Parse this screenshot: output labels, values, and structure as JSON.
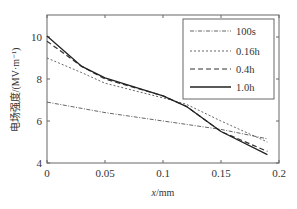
{
  "chart_data": {
    "type": "line",
    "title": "",
    "xlabel": "x/mm",
    "ylabel": "电场强度/(MV·m⁻¹)",
    "xlim": [
      0,
      0.2
    ],
    "ylim": [
      4,
      11
    ],
    "xticks": [
      0,
      0.05,
      0.1,
      0.15,
      0.2
    ],
    "xtick_labels": [
      "0",
      "0.05",
      "0.1",
      "0.15",
      "0.2"
    ],
    "yticks": [
      4,
      6,
      8,
      10
    ],
    "ytick_labels": [
      "4",
      "6",
      "8",
      "10"
    ],
    "grid": false,
    "legend_position": "upper right",
    "series": [
      {
        "name": "100s",
        "style": "dash-dot",
        "color": "#555555",
        "x": [
          0,
          0.05,
          0.1,
          0.15,
          0.19
        ],
        "y": [
          6.9,
          6.4,
          6.0,
          5.6,
          5.15
        ]
      },
      {
        "name": "0.16h",
        "style": "dotted",
        "color": "#555555",
        "x": [
          0,
          0.03,
          0.05,
          0.1,
          0.12,
          0.15,
          0.19
        ],
        "y": [
          9.0,
          8.3,
          7.8,
          7.1,
          6.8,
          6.0,
          5.0
        ]
      },
      {
        "name": "0.4h",
        "style": "dashed",
        "color": "#333333",
        "x": [
          0,
          0.03,
          0.05,
          0.1,
          0.12,
          0.15,
          0.19
        ],
        "y": [
          9.8,
          8.6,
          8.0,
          7.2,
          6.7,
          5.5,
          4.55
        ]
      },
      {
        "name": "1.0h",
        "style": "solid",
        "color": "#222222",
        "x": [
          0,
          0.03,
          0.05,
          0.1,
          0.12,
          0.15,
          0.19
        ],
        "y": [
          10.05,
          8.6,
          8.05,
          7.2,
          6.7,
          5.5,
          4.4
        ]
      }
    ]
  }
}
